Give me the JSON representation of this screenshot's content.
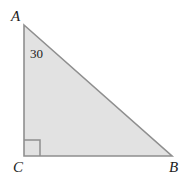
{
  "figure": {
    "kind": "right-triangle-diagram",
    "background_color": "#ffffff",
    "fill_color": "#e2e2e2",
    "stroke_color": "#8f8f8f",
    "text_color": "#1c1c1c",
    "stroke_width": 1.6,
    "width": 190,
    "height": 187,
    "vertices": {
      "A": {
        "label": "A",
        "x": 24,
        "y": 25
      },
      "B": {
        "label": "B",
        "x": 172,
        "y": 156
      },
      "C": {
        "label": "C",
        "x": 24,
        "y": 156
      }
    },
    "angles": [
      {
        "at": "A",
        "label": "30",
        "value": 30,
        "unit": "degrees",
        "label_x": 30,
        "label_y": 47
      },
      {
        "at": "C",
        "label": "",
        "value": 90,
        "unit": "degrees",
        "marker": "right-angle-square",
        "marker_size": 16
      }
    ],
    "sides": [
      {
        "name": "AC",
        "from": "A",
        "to": "C",
        "type": "leg-vertical"
      },
      {
        "name": "CB",
        "from": "C",
        "to": "B",
        "type": "leg-horizontal"
      },
      {
        "name": "AB",
        "from": "A",
        "to": "B",
        "type": "hypotenuse"
      }
    ],
    "polygon_points": "24,25 172,156 24,156",
    "right_angle_path": "M 40 156 L 40 140 L 24 140"
  }
}
